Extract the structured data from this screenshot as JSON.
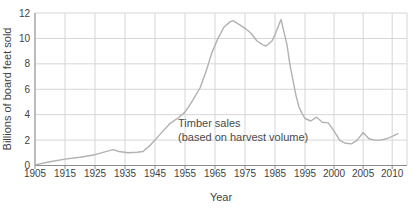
{
  "chart_data": {
    "type": "line",
    "title": "",
    "xlabel": "Year",
    "ylabel": "Billions of board feet sold",
    "annotation": {
      "line1": "Timber sales",
      "line2": "(based on harvest volume)"
    },
    "x_ticks": [
      1905,
      1915,
      1925,
      1935,
      1945,
      1955,
      1965,
      1975,
      1985,
      1995,
      2000,
      2005,
      2010
    ],
    "x_tick_labels": [
      "1905",
      "1915",
      "1925",
      "1935",
      "1945",
      "1955",
      "1965",
      "1975",
      "1985",
      "1995",
      "2000",
      "2005",
      "2010"
    ],
    "y_ticks": [
      0,
      2,
      4,
      6,
      8,
      10,
      12
    ],
    "y_tick_labels": [
      "0",
      "2",
      "4",
      "6",
      "8",
      "10",
      "12"
    ],
    "ylim": [
      0,
      12
    ],
    "grid": true,
    "legend": "none",
    "x_scale_note": "axis is 10-year steps up to 1995, then 5-year steps at equal pixel spacing",
    "x_scale_anchors": [
      {
        "year": 1905,
        "x": 35
      },
      {
        "year": 1995,
        "x": 305
      },
      {
        "year": 2011,
        "x": 398
      }
    ],
    "series": [
      {
        "name": "Timber sales (based on harvest volume)",
        "points": [
          [
            1905,
            0.05
          ],
          [
            1910,
            0.3
          ],
          [
            1915,
            0.5
          ],
          [
            1920,
            0.65
          ],
          [
            1925,
            0.85
          ],
          [
            1928,
            1.05
          ],
          [
            1931,
            1.25
          ],
          [
            1933,
            1.1
          ],
          [
            1936,
            1.0
          ],
          [
            1939,
            1.05
          ],
          [
            1941,
            1.1
          ],
          [
            1943,
            1.5
          ],
          [
            1945,
            2.0
          ],
          [
            1948,
            2.8
          ],
          [
            1950,
            3.3
          ],
          [
            1953,
            3.8
          ],
          [
            1955,
            4.2
          ],
          [
            1957,
            4.9
          ],
          [
            1960,
            6.1
          ],
          [
            1962,
            7.4
          ],
          [
            1964,
            8.9
          ],
          [
            1966,
            10.0
          ],
          [
            1968,
            10.9
          ],
          [
            1970,
            11.3
          ],
          [
            1971,
            11.4
          ],
          [
            1973,
            11.1
          ],
          [
            1975,
            10.8
          ],
          [
            1977,
            10.4
          ],
          [
            1979,
            9.8
          ],
          [
            1981,
            9.5
          ],
          [
            1982,
            9.4
          ],
          [
            1984,
            9.8
          ],
          [
            1985,
            10.3
          ],
          [
            1987,
            11.5
          ],
          [
            1989,
            9.5
          ],
          [
            1990,
            7.9
          ],
          [
            1992,
            5.5
          ],
          [
            1993,
            4.6
          ],
          [
            1994,
            4.1
          ],
          [
            1995,
            3.7
          ],
          [
            1996,
            3.5
          ],
          [
            1997,
            3.8
          ],
          [
            1998,
            3.4
          ],
          [
            1999,
            3.35
          ],
          [
            2000,
            2.7
          ],
          [
            2001,
            1.95
          ],
          [
            2002,
            1.75
          ],
          [
            2003,
            1.7
          ],
          [
            2004,
            2.0
          ],
          [
            2005,
            2.6
          ],
          [
            2006,
            2.1
          ],
          [
            2007,
            2.0
          ],
          [
            2008,
            2.0
          ],
          [
            2009,
            2.1
          ],
          [
            2010,
            2.3
          ],
          [
            2011,
            2.5
          ]
        ]
      }
    ],
    "colors": {
      "line": "#b1b1b1",
      "grid": "#d6d6d6",
      "axis": "#8c8c8c",
      "text": "#3f3f3f",
      "background": "#ffffff"
    }
  }
}
